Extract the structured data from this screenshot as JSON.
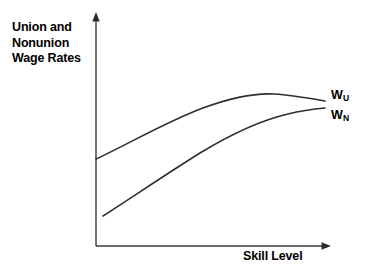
{
  "figure": {
    "background_color": "#ffffff",
    "line_color": "#2e2e2e",
    "axis_color": "#3a3a3a"
  },
  "labels": {
    "y_axis_title": "Union and\nNonunion\nWage Rates",
    "x_axis_title": "Skill Level",
    "series_union_base": "W",
    "series_union_sub": "U",
    "series_nonunion_base": "W",
    "series_nonunion_sub": "N"
  },
  "chart_data": {
    "type": "line",
    "title": "",
    "xlabel": "Skill Level",
    "ylabel": "Union and Nonunion Wage Rates",
    "grid": false,
    "legend_position": "right-inline",
    "axes": {
      "x_ticks": [],
      "y_ticks": [],
      "x_arrow": true,
      "y_arrow": true,
      "xlim": [
        0,
        1
      ],
      "ylim": [
        0,
        1
      ]
    },
    "annotations": [
      "Union wage curve W_U lies above nonunion curve W_N at all skill levels",
      "Union wage premium is largest at low skill levels and narrows as skill rises",
      "W_U peaks near high skill and turns down slightly"
    ],
    "series": [
      {
        "name": "W_U",
        "label": "Union wage rate",
        "description": "Rises steeply from a moderate intercept, concave, peaks then declines slightly",
        "x": [
          0.0,
          0.12,
          0.25,
          0.38,
          0.5,
          0.62,
          0.76,
          0.88,
          1.0
        ],
        "y": [
          0.38,
          0.5,
          0.61,
          0.71,
          0.79,
          0.85,
          0.89,
          0.885,
          0.855
        ]
      },
      {
        "name": "W_N",
        "label": "Nonunion wage rate",
        "description": "Starts lower and to the right, rises steadily, concave, flattens at high skill",
        "x": [
          0.03,
          0.15,
          0.28,
          0.41,
          0.54,
          0.67,
          0.8,
          0.91,
          1.0
        ],
        "y": [
          0.1,
          0.22,
          0.35,
          0.47,
          0.58,
          0.68,
          0.75,
          0.79,
          0.8
        ]
      }
    ]
  }
}
